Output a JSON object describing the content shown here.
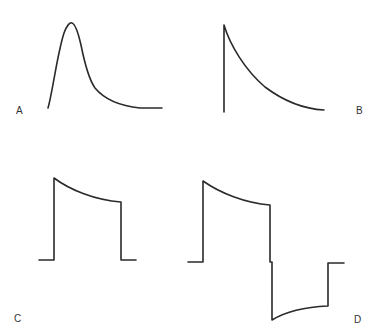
{
  "panels": [
    {
      "id": "A",
      "label": "A",
      "description": "smooth peak with gradual decay"
    },
    {
      "id": "B",
      "label": "B",
      "description": "instantaneous rise with exponential decay"
    },
    {
      "id": "C",
      "label": "C",
      "description": "rectangular pulse with drooping top"
    },
    {
      "id": "D",
      "label": "D",
      "description": "biphasic pulse with droop and undershoot recovery"
    }
  ],
  "colors": {
    "stroke": "#2a2a2a",
    "label": "#333333",
    "background": "#ffffff"
  }
}
